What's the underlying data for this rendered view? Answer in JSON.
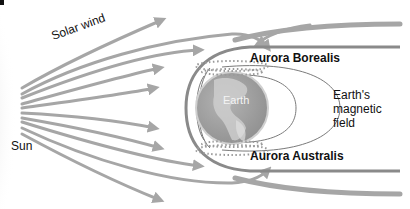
{
  "labels": {
    "solar_wind": "Solar wind",
    "sun": "Sun",
    "earth": "Earth",
    "aurora_borealis": "Aurora Borealis",
    "aurora_australis": "Aurora Australis",
    "magnetic_field": "Earth's\nmagnetic\nfield"
  },
  "colors": {
    "arrow": "#a6a6a6",
    "magnetopause": "#8a8a8a",
    "field_line": "#7a7a7a",
    "earth": "#9c9c9c",
    "text": "#111111",
    "sun_glow": "#e6e6e6"
  }
}
